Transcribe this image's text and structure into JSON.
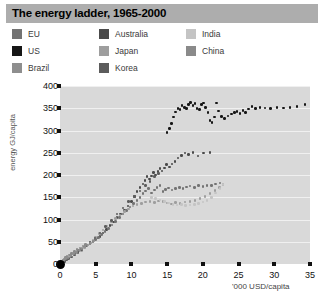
{
  "header": {
    "title": "The energy ladder, 1965-2000",
    "bar_color": "#adadad"
  },
  "legend": {
    "columns": [
      {
        "items": [
          {
            "label": "EU",
            "color": "#737373"
          },
          {
            "label": "US",
            "color": "#161616"
          },
          {
            "label": "Brazil",
            "color": "#8e8e8e"
          }
        ]
      },
      {
        "items": [
          {
            "label": "Australia",
            "color": "#4a4a4a"
          },
          {
            "label": "Japan",
            "color": "#9e9e9e"
          },
          {
            "label": "Korea",
            "color": "#5c5c5c"
          }
        ]
      },
      {
        "items": [
          {
            "label": "India",
            "color": "#c4c4c4"
          },
          {
            "label": "China",
            "color": "#8a8a8a"
          }
        ]
      }
    ]
  },
  "chart_data": {
    "type": "scatter",
    "title": "The energy ladder, 1965-2000",
    "xlabel": "'000 USD/capita",
    "ylabel": "energy GJ/capita",
    "xlim": [
      0,
      35
    ],
    "ylim": [
      0,
      400
    ],
    "xticks": [
      0,
      5,
      10,
      15,
      20,
      25,
      30,
      35
    ],
    "yticks": [
      0,
      50,
      100,
      150,
      200,
      250,
      300,
      350,
      400
    ],
    "grid": "horizontal",
    "legend_position": "top",
    "panel_color": "#d9d9d9",
    "series": [
      {
        "name": "US",
        "color": "#161616",
        "points": [
          [
            15.0,
            295
          ],
          [
            15.3,
            305
          ],
          [
            15.6,
            316
          ],
          [
            15.9,
            330
          ],
          [
            16.2,
            342
          ],
          [
            16.5,
            350
          ],
          [
            16.8,
            347
          ],
          [
            17.1,
            356
          ],
          [
            17.4,
            352
          ],
          [
            17.7,
            349
          ],
          [
            18.0,
            358
          ],
          [
            18.3,
            363
          ],
          [
            18.6,
            356
          ],
          [
            18.9,
            361
          ],
          [
            19.2,
            350
          ],
          [
            19.5,
            347
          ],
          [
            19.8,
            358
          ],
          [
            20.1,
            362
          ],
          [
            20.4,
            352
          ],
          [
            20.7,
            340
          ],
          [
            21.0,
            322
          ],
          [
            21.3,
            318
          ],
          [
            21.6,
            330
          ],
          [
            21.9,
            362
          ],
          [
            22.2,
            344
          ],
          [
            22.6,
            332
          ],
          [
            23.0,
            327
          ],
          [
            23.5,
            333
          ],
          [
            24.0,
            337
          ],
          [
            24.4,
            340
          ],
          [
            24.8,
            343
          ],
          [
            25.2,
            338
          ],
          [
            25.6,
            345
          ],
          [
            26.0,
            341
          ],
          [
            26.4,
            348
          ],
          [
            26.9,
            354
          ],
          [
            27.4,
            350
          ],
          [
            28.0,
            352
          ],
          [
            28.7,
            351
          ],
          [
            29.5,
            350
          ],
          [
            30.4,
            352
          ],
          [
            31.3,
            351
          ],
          [
            32.2,
            352
          ],
          [
            33.2,
            354
          ],
          [
            34.3,
            358
          ]
        ]
      },
      {
        "name": "Australia",
        "color": "#4a4a4a",
        "points": [
          [
            5.2,
            58
          ],
          [
            5.6,
            62
          ],
          [
            6.0,
            70
          ],
          [
            6.5,
            78
          ],
          [
            7.0,
            86
          ],
          [
            7.5,
            94
          ],
          [
            8.0,
            104
          ],
          [
            8.5,
            112
          ],
          [
            9.0,
            120
          ],
          [
            9.5,
            130
          ],
          [
            10.0,
            140
          ],
          [
            10.4,
            152
          ],
          [
            10.8,
            163
          ],
          [
            11.2,
            172
          ],
          [
            11.6,
            180
          ],
          [
            11.9,
            188
          ],
          [
            12.2,
            196
          ],
          [
            12.5,
            191
          ],
          [
            12.8,
            198
          ],
          [
            13.1,
            205
          ],
          [
            13.4,
            200
          ],
          [
            13.7,
            208
          ],
          [
            14.0,
            214
          ],
          [
            14.3,
            209
          ],
          [
            14.6,
            216
          ],
          [
            14.9,
            223
          ],
          [
            15.3,
            218
          ],
          [
            15.7,
            225
          ],
          [
            16.1,
            230
          ],
          [
            16.5,
            238
          ],
          [
            17.0,
            244
          ],
          [
            17.5,
            249
          ],
          [
            18.0,
            246
          ],
          [
            18.6,
            250
          ],
          [
            19.3,
            243
          ],
          [
            20.1,
            249
          ],
          [
            21.0,
            251
          ]
        ]
      },
      {
        "name": "EU",
        "color": "#737373",
        "points": [
          [
            2.2,
            26
          ],
          [
            2.6,
            30
          ],
          [
            3.0,
            34
          ],
          [
            3.4,
            38
          ],
          [
            3.8,
            42
          ],
          [
            4.2,
            46
          ],
          [
            4.6,
            50
          ],
          [
            5.0,
            55
          ],
          [
            5.4,
            60
          ],
          [
            5.8,
            66
          ],
          [
            6.3,
            73
          ],
          [
            6.8,
            80
          ],
          [
            7.3,
            88
          ],
          [
            7.8,
            96
          ],
          [
            8.3,
            104
          ],
          [
            8.8,
            112
          ],
          [
            9.3,
            120
          ],
          [
            9.8,
            128
          ],
          [
            10.3,
            136
          ],
          [
            10.8,
            143
          ],
          [
            11.2,
            150
          ],
          [
            11.6,
            158
          ],
          [
            12.0,
            164
          ],
          [
            12.4,
            170
          ],
          [
            12.8,
            160
          ],
          [
            13.2,
            166
          ],
          [
            13.6,
            172
          ],
          [
            14.0,
            176
          ],
          [
            14.4,
            163
          ],
          [
            14.8,
            168
          ],
          [
            15.2,
            171
          ],
          [
            15.7,
            166
          ],
          [
            16.2,
            169
          ],
          [
            16.7,
            172
          ],
          [
            17.2,
            170
          ],
          [
            17.7,
            173
          ],
          [
            18.2,
            175
          ],
          [
            18.8,
            172
          ],
          [
            19.4,
            176
          ],
          [
            20.0,
            174
          ],
          [
            20.6,
            177
          ],
          [
            21.2,
            176
          ],
          [
            21.8,
            180
          ],
          [
            22.4,
            182
          ]
        ]
      },
      {
        "name": "Japan",
        "color": "#9e9e9e",
        "points": [
          [
            3.0,
            30
          ],
          [
            3.4,
            36
          ],
          [
            3.8,
            42
          ],
          [
            4.2,
            48
          ],
          [
            4.6,
            54
          ],
          [
            5.0,
            60
          ],
          [
            5.5,
            68
          ],
          [
            6.0,
            76
          ],
          [
            6.6,
            85
          ],
          [
            7.2,
            94
          ],
          [
            7.8,
            102
          ],
          [
            8.4,
            110
          ],
          [
            9.0,
            118
          ],
          [
            9.6,
            124
          ],
          [
            10.2,
            130
          ],
          [
            10.8,
            134
          ],
          [
            11.4,
            136
          ],
          [
            12.0,
            139
          ],
          [
            12.6,
            141
          ],
          [
            13.2,
            138
          ],
          [
            13.8,
            142
          ],
          [
            14.4,
            140
          ],
          [
            15.0,
            137
          ],
          [
            15.6,
            135
          ],
          [
            16.2,
            138
          ],
          [
            16.8,
            136
          ],
          [
            17.5,
            139
          ],
          [
            18.2,
            141
          ],
          [
            18.9,
            143
          ],
          [
            19.6,
            147
          ],
          [
            20.3,
            152
          ],
          [
            21.0,
            158
          ],
          [
            21.7,
            165
          ],
          [
            22.3,
            172
          ],
          [
            22.8,
            178
          ]
        ]
      },
      {
        "name": "Korea",
        "color": "#5c5c5c",
        "points": [
          [
            0.6,
            6
          ],
          [
            0.9,
            9
          ],
          [
            1.2,
            12
          ],
          [
            1.6,
            16
          ],
          [
            2.0,
            20
          ],
          [
            2.5,
            26
          ],
          [
            3.0,
            32
          ],
          [
            3.6,
            40
          ],
          [
            4.2,
            48
          ],
          [
            4.9,
            58
          ],
          [
            5.6,
            70
          ],
          [
            6.4,
            84
          ],
          [
            7.2,
            98
          ],
          [
            8.0,
            112
          ],
          [
            8.8,
            126
          ],
          [
            9.6,
            140
          ],
          [
            10.4,
            152
          ],
          [
            11.2,
            164
          ],
          [
            12.0,
            176
          ],
          [
            12.6,
            186
          ],
          [
            13.2,
            196
          ],
          [
            13.8,
            204
          ]
        ]
      },
      {
        "name": "China",
        "color": "#8a8a8a",
        "points": [
          [
            0.2,
            5
          ],
          [
            0.3,
            7
          ],
          [
            0.4,
            9
          ],
          [
            0.6,
            11
          ],
          [
            0.8,
            14
          ],
          [
            1.0,
            17
          ],
          [
            1.3,
            20
          ],
          [
            1.6,
            24
          ],
          [
            2.0,
            28
          ],
          [
            2.4,
            32
          ],
          [
            2.8,
            36
          ],
          [
            3.2,
            40
          ],
          [
            3.6,
            44
          ]
        ]
      },
      {
        "name": "India",
        "color": "#c4c4c4",
        "points": [
          [
            12.8,
            150
          ],
          [
            13.4,
            147
          ],
          [
            14.0,
            144
          ],
          [
            14.6,
            140
          ],
          [
            15.2,
            137
          ],
          [
            15.8,
            134
          ],
          [
            16.4,
            133
          ],
          [
            17.0,
            134
          ],
          [
            17.6,
            132
          ],
          [
            18.2,
            133
          ],
          [
            18.8,
            134
          ],
          [
            19.4,
            136
          ],
          [
            20.0,
            139
          ],
          [
            20.6,
            143
          ],
          [
            21.2,
            150
          ],
          [
            21.8,
            160
          ],
          [
            22.4,
            170
          ],
          [
            22.8,
            178
          ]
        ]
      },
      {
        "name": "Brazil",
        "color": "#8e8e8e",
        "points": [
          [
            0.5,
            8
          ],
          [
            0.8,
            12
          ],
          [
            1.1,
            15
          ],
          [
            1.5,
            19
          ],
          [
            1.9,
            23
          ],
          [
            2.3,
            27
          ],
          [
            2.7,
            31
          ],
          [
            3.1,
            35
          ],
          [
            3.5,
            39
          ],
          [
            3.9,
            43
          ],
          [
            4.3,
            47
          ],
          [
            4.7,
            52
          ]
        ]
      }
    ]
  }
}
